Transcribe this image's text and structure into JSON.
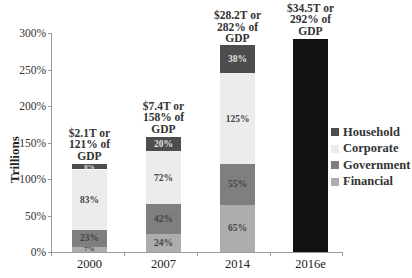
{
  "chart_data": {
    "type": "bar",
    "stacked": true,
    "title": "",
    "xlabel": "",
    "ylabel": "Trillions",
    "ylim": [
      0,
      300
    ],
    "y_ticks": [
      "0%",
      "50%",
      "100%",
      "150%",
      "200%",
      "250%",
      "300%"
    ],
    "categories": [
      "2000",
      "2007",
      "2014",
      "2016e"
    ],
    "series": [
      {
        "name": "Financial",
        "color": "#adadad",
        "values": [
          7,
          24,
          65,
          null
        ],
        "labels": [
          "7%",
          "24%",
          "65%",
          ""
        ]
      },
      {
        "name": "Government",
        "color": "#7f7f7f",
        "values": [
          23,
          42,
          55,
          null
        ],
        "labels": [
          "23%",
          "42%",
          "55%",
          ""
        ]
      },
      {
        "name": "Corporate",
        "color": "#ececec",
        "values": [
          83,
          72,
          125,
          null
        ],
        "labels": [
          "83%",
          "72%",
          "125%",
          ""
        ]
      },
      {
        "name": "Household",
        "color": "#4d4d4d",
        "values": [
          8,
          20,
          38,
          null
        ],
        "labels": [
          "8%",
          "20%",
          "38%",
          ""
        ]
      }
    ],
    "totals": [
      {
        "category": "2000",
        "value": 121,
        "line1": "$2.1T or",
        "line2": "121% of",
        "line3": "GDP"
      },
      {
        "category": "2007",
        "value": 158,
        "line1": "$7.4T or",
        "line2": "158% of",
        "line3": "GDP"
      },
      {
        "category": "2014",
        "value": 282,
        "line1": "$28.2T or",
        "line2": "282% of",
        "line3": "GDP"
      },
      {
        "category": "2016e",
        "value": 292,
        "line1": "$34.5T or",
        "line2": "292% of",
        "line3": "GDP",
        "solid_color": "#111111"
      }
    ],
    "legend": [
      "Household",
      "Corporate",
      "Government",
      "Financial"
    ],
    "legend_position": "right",
    "grid": false
  }
}
